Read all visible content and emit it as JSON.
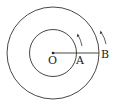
{
  "diagram": {
    "center_label": "O",
    "inner_point_label": "A",
    "outer_point_label": "B",
    "center": [
      53,
      53
    ],
    "inner_radius": 23.5,
    "outer_radius": 46,
    "stroke_color": "#333333"
  }
}
